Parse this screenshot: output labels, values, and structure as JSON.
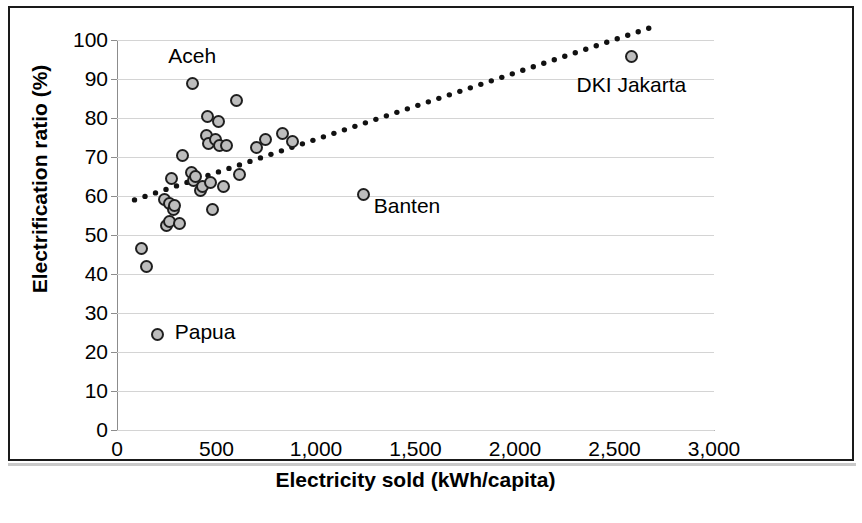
{
  "chart_data": {
    "type": "scatter",
    "title": "",
    "xlabel": "Electricity sold (kWh/capita)",
    "ylabel": "Electrification ratio (%)",
    "xlim": [
      0,
      3000
    ],
    "ylim": [
      0,
      100
    ],
    "xticks": [
      "0",
      "500",
      "1,000",
      "1,500",
      "2,000",
      "2,500",
      "3,000"
    ],
    "xtick_values": [
      0,
      500,
      1000,
      1500,
      2000,
      2500,
      3000
    ],
    "yticks": [
      "0",
      "10",
      "20",
      "30",
      "40",
      "50",
      "60",
      "70",
      "80",
      "90",
      "100"
    ],
    "ytick_values": [
      0,
      10,
      20,
      30,
      40,
      50,
      60,
      70,
      80,
      90,
      100
    ],
    "grid": "horizontal",
    "legend": "none",
    "marker_fill": "#bdbdbd",
    "marker_edge": "#1f1f1f",
    "points": [
      {
        "x": 125,
        "y": 46.5,
        "label": ""
      },
      {
        "x": 150,
        "y": 42.0,
        "label": ""
      },
      {
        "x": 205,
        "y": 24.5,
        "label": "Papua"
      },
      {
        "x": 240,
        "y": 59.0,
        "label": ""
      },
      {
        "x": 248,
        "y": 52.5,
        "label": ""
      },
      {
        "x": 262,
        "y": 58.0,
        "label": ""
      },
      {
        "x": 265,
        "y": 53.5,
        "label": ""
      },
      {
        "x": 272,
        "y": 64.5,
        "label": ""
      },
      {
        "x": 285,
        "y": 56.5,
        "label": ""
      },
      {
        "x": 290,
        "y": 57.5,
        "label": ""
      },
      {
        "x": 312,
        "y": 53.0,
        "label": ""
      },
      {
        "x": 330,
        "y": 70.5,
        "label": ""
      },
      {
        "x": 372,
        "y": 66.0,
        "label": ""
      },
      {
        "x": 378,
        "y": 88.8,
        "label": "Aceh"
      },
      {
        "x": 382,
        "y": 64.0,
        "label": ""
      },
      {
        "x": 395,
        "y": 65.0,
        "label": ""
      },
      {
        "x": 418,
        "y": 61.5,
        "label": ""
      },
      {
        "x": 432,
        "y": 62.5,
        "label": ""
      },
      {
        "x": 452,
        "y": 75.5,
        "label": ""
      },
      {
        "x": 455,
        "y": 80.5,
        "label": ""
      },
      {
        "x": 462,
        "y": 73.5,
        "label": ""
      },
      {
        "x": 468,
        "y": 63.5,
        "label": ""
      },
      {
        "x": 478,
        "y": 56.5,
        "label": ""
      },
      {
        "x": 495,
        "y": 74.5,
        "label": ""
      },
      {
        "x": 512,
        "y": 79.0,
        "label": ""
      },
      {
        "x": 515,
        "y": 73.0,
        "label": ""
      },
      {
        "x": 535,
        "y": 62.5,
        "label": ""
      },
      {
        "x": 548,
        "y": 73.0,
        "label": ""
      },
      {
        "x": 600,
        "y": 84.5,
        "label": ""
      },
      {
        "x": 618,
        "y": 65.5,
        "label": ""
      },
      {
        "x": 700,
        "y": 72.5,
        "label": ""
      },
      {
        "x": 745,
        "y": 74.5,
        "label": ""
      },
      {
        "x": 830,
        "y": 76.0,
        "label": ""
      },
      {
        "x": 880,
        "y": 74.0,
        "label": ""
      },
      {
        "x": 1238,
        "y": 60.5,
        "label": "Banten"
      },
      {
        "x": 2585,
        "y": 95.8,
        "label": "DKI Jakarta"
      }
    ],
    "trendline": {
      "style": "dotted",
      "color": "#111111",
      "x_start": 88,
      "y_start": 59.0,
      "x_end": 2672,
      "y_end": 103.0
    },
    "annotations": [
      {
        "text": "Aceh",
        "x": 378,
        "y": 95.5
      },
      {
        "text": "Papua",
        "x": 290,
        "y": 24.5
      },
      {
        "text": "Banten",
        "x": 1290,
        "y": 57.0
      },
      {
        "text": "DKI Jakarta",
        "x": 2585,
        "y": 88.0
      }
    ]
  }
}
